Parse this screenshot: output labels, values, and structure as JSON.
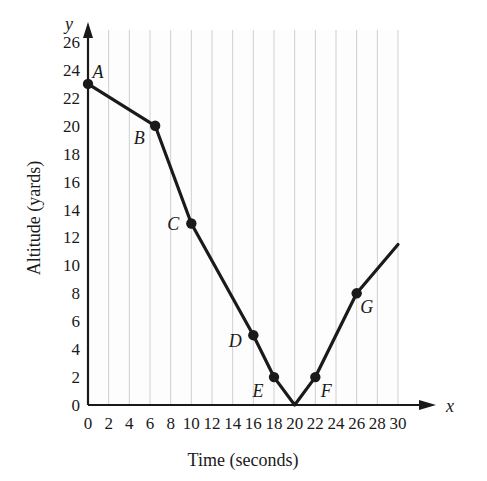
{
  "chart_data": {
    "type": "line",
    "title": "",
    "xlabel": "Time (seconds)",
    "ylabel": "Altitude (yards)",
    "x_axis_variable": "x",
    "y_axis_variable": "y",
    "xlim": [
      0,
      30
    ],
    "ylim": [
      0,
      26
    ],
    "xticks": [
      0,
      2,
      4,
      6,
      8,
      10,
      12,
      14,
      16,
      18,
      20,
      22,
      24,
      26,
      28,
      30
    ],
    "yticks": [
      0,
      2,
      4,
      6,
      8,
      10,
      12,
      14,
      16,
      18,
      20,
      22,
      24,
      26
    ],
    "xtick_labels": [
      "0",
      "2",
      "4",
      "6",
      "8",
      "10",
      "12",
      "14",
      "16",
      "18",
      "20",
      "22",
      "24",
      "26",
      "28",
      "30"
    ],
    "ytick_labels": [
      "0",
      "2",
      "4",
      "6",
      "8",
      "10",
      "12",
      "14",
      "16",
      "18",
      "20",
      "22",
      "24",
      "26"
    ],
    "grid": "vertical-only",
    "grid_color": "#cfcfd4",
    "legend": "none",
    "line_color": "#1a1a1a",
    "marker_color": "#1a1a1a",
    "x": [
      0,
      6.5,
      10,
      16,
      18,
      20,
      22,
      26,
      30
    ],
    "y": [
      23,
      20,
      13,
      5,
      2,
      0,
      2,
      8,
      11.5
    ],
    "labeled_points": [
      {
        "label": "A",
        "x": 0,
        "y": 23,
        "label_dx": 10,
        "label_dy": -6
      },
      {
        "label": "B",
        "x": 6.5,
        "y": 20,
        "label_dx": -16,
        "label_dy": 18
      },
      {
        "label": "C",
        "x": 10,
        "y": 13,
        "label_dx": -18,
        "label_dy": 6
      },
      {
        "label": "D",
        "x": 16,
        "y": 5,
        "label_dx": -18,
        "label_dy": 12
      },
      {
        "label": "E",
        "x": 18,
        "y": 2,
        "label_dx": -16,
        "label_dy": 20
      },
      {
        "label": "F",
        "x": 22,
        "y": 2,
        "label_dx": 11,
        "label_dy": 20
      },
      {
        "label": "G",
        "x": 26,
        "y": 8,
        "label_dx": 10,
        "label_dy": 20
      }
    ],
    "unlabeled_vertices": [
      {
        "x": 20,
        "y": 0
      },
      {
        "x": 30,
        "y": 11.5
      }
    ],
    "annotations": []
  }
}
